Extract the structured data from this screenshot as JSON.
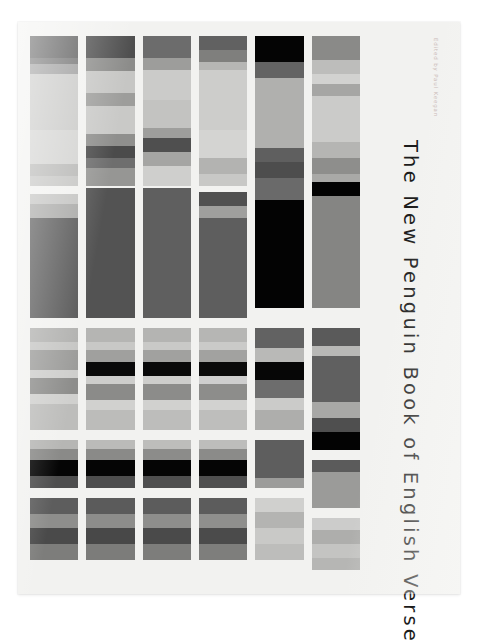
{
  "cover": {
    "title": "The New Penguin Book of English Verse",
    "credit": "Edited by Paul Keegan",
    "background": "#f2f2f0",
    "page_background": "#ffffff",
    "title_color": "#1b1b1b",
    "credit_color": "#c9b9b6"
  },
  "chart_data": {
    "type": "heatmap",
    "title": "The New Penguin Book of English Verse",
    "xlabel": "",
    "ylabel": "",
    "grid": false,
    "legend": "none",
    "columns": 6,
    "bands": 4,
    "column_width_px": 56,
    "column_gap_px": 8,
    "series": [
      {
        "name": "column-1",
        "blocks": [
          {
            "name": "block-1-1",
            "top": 0,
            "height": 150,
            "stripes": [
              {
                "color": "#5a5a5a",
                "height": 22
              },
              {
                "color": "#6e6e6e",
                "height": 6
              },
              {
                "color": "#9a9a9a",
                "height": 10
              },
              {
                "color": "#c8c8c6",
                "height": 56
              },
              {
                "color": "#d2d2d0",
                "height": 34
              },
              {
                "color": "#b7b7b5",
                "height": 12
              },
              {
                "color": "#c5c5c3",
                "height": 10
              }
            ]
          },
          {
            "name": "block-1-2",
            "top": 158,
            "height": 124,
            "stripes": [
              {
                "color": "#c3c3c1",
                "height": 10
              },
              {
                "color": "#a9a9a7",
                "height": 14
              },
              {
                "color": "#595959",
                "height": 100
              }
            ]
          },
          {
            "name": "block-1-3",
            "top": 292,
            "height": 102,
            "stripes": [
              {
                "color": "#b2b2b0",
                "height": 14
              },
              {
                "color": "#c6c6c4",
                "height": 8
              },
              {
                "color": "#9c9c9a",
                "height": 20
              },
              {
                "color": "#cececc",
                "height": 8
              },
              {
                "color": "#8d8d8b",
                "height": 16
              },
              {
                "color": "#d0d0ce",
                "height": 10
              },
              {
                "color": "#bdbdbb",
                "height": 26
              }
            ]
          },
          {
            "name": "block-1-4",
            "top": 404,
            "height": 48,
            "stripes": [
              {
                "color": "#b6b6b4",
                "height": 9
              },
              {
                "color": "#8a8a88",
                "height": 11
              },
              {
                "color": "#050505",
                "height": 16
              },
              {
                "color": "#4e4e4e",
                "height": 12
              }
            ]
          },
          {
            "name": "block-1-5",
            "top": 462,
            "height": 62,
            "stripes": [
              {
                "color": "#5d5d5d",
                "height": 16
              },
              {
                "color": "#8e8e8c",
                "height": 14
              },
              {
                "color": "#4a4a4a",
                "height": 16
              },
              {
                "color": "#7d7d7b",
                "height": 16
              }
            ]
          }
        ]
      },
      {
        "name": "column-2",
        "blocks": [
          {
            "name": "block-2-1",
            "top": 0,
            "height": 150,
            "stripes": [
              {
                "color": "#4e4e4e",
                "height": 22
              },
              {
                "color": "#8c8c8a",
                "height": 13
              },
              {
                "color": "#c6c6c4",
                "height": 22
              },
              {
                "color": "#9d9d9b",
                "height": 13
              },
              {
                "color": "#c9c9c7",
                "height": 28
              },
              {
                "color": "#8f8f8d",
                "height": 12
              },
              {
                "color": "#4b4b4b",
                "height": 12
              },
              {
                "color": "#6e6e6e",
                "height": 10
              },
              {
                "color": "#969694",
                "height": 18
              }
            ]
          },
          {
            "name": "block-2-2",
            "top": 152,
            "height": 130,
            "stripes": [
              {
                "color": "#535353",
                "height": 130
              }
            ]
          },
          {
            "name": "block-2-3",
            "top": 292,
            "height": 102,
            "stripes": [
              {
                "color": "#b5b5b3",
                "height": 14
              },
              {
                "color": "#c8c8c6",
                "height": 8
              },
              {
                "color": "#a0a09e",
                "height": 12
              },
              {
                "color": "#0a0a0a",
                "height": 14
              },
              {
                "color": "#cdcdcb",
                "height": 8
              },
              {
                "color": "#8b8b89",
                "height": 16
              },
              {
                "color": "#d1d1cf",
                "height": 10
              },
              {
                "color": "#bcbcba",
                "height": 20
              }
            ]
          },
          {
            "name": "block-2-4",
            "top": 404,
            "height": 48,
            "stripes": [
              {
                "color": "#bbbbb9",
                "height": 9
              },
              {
                "color": "#8a8a88",
                "height": 11
              },
              {
                "color": "#050505",
                "height": 16
              },
              {
                "color": "#4e4e4e",
                "height": 12
              }
            ]
          },
          {
            "name": "block-2-5",
            "top": 462,
            "height": 62,
            "stripes": [
              {
                "color": "#5b5b5b",
                "height": 16
              },
              {
                "color": "#8d8d8b",
                "height": 14
              },
              {
                "color": "#484848",
                "height": 16
              },
              {
                "color": "#7c7c7a",
                "height": 16
              }
            ]
          }
        ]
      },
      {
        "name": "column-3",
        "blocks": [
          {
            "name": "block-3-1",
            "top": 0,
            "height": 150,
            "stripes": [
              {
                "color": "#6c6c6c",
                "height": 22
              },
              {
                "color": "#9d9d9b",
                "height": 12
              },
              {
                "color": "#cbcbc9",
                "height": 30
              },
              {
                "color": "#c3c3c1",
                "height": 28
              },
              {
                "color": "#9e9e9c",
                "height": 10
              },
              {
                "color": "#4f4f4f",
                "height": 14
              },
              {
                "color": "#a5a5a3",
                "height": 14
              },
              {
                "color": "#cfcfcd",
                "height": 20
              }
            ]
          },
          {
            "name": "block-3-2",
            "top": 152,
            "height": 130,
            "stripes": [
              {
                "color": "#5f5f5f",
                "height": 130
              }
            ]
          },
          {
            "name": "block-3-3",
            "top": 292,
            "height": 102,
            "stripes": [
              {
                "color": "#b4b4b2",
                "height": 14
              },
              {
                "color": "#c9c9c7",
                "height": 8
              },
              {
                "color": "#a1a19f",
                "height": 12
              },
              {
                "color": "#090909",
                "height": 14
              },
              {
                "color": "#cdcdcb",
                "height": 8
              },
              {
                "color": "#8c8c8a",
                "height": 16
              },
              {
                "color": "#d1d1cf",
                "height": 10
              },
              {
                "color": "#bdbdbb",
                "height": 20
              }
            ]
          },
          {
            "name": "block-3-4",
            "top": 404,
            "height": 48,
            "stripes": [
              {
                "color": "#bdbdbb",
                "height": 9
              },
              {
                "color": "#8c8c8a",
                "height": 11
              },
              {
                "color": "#050505",
                "height": 16
              },
              {
                "color": "#4f4f4f",
                "height": 12
              }
            ]
          },
          {
            "name": "block-3-5",
            "top": 462,
            "height": 62,
            "stripes": [
              {
                "color": "#5c5c5c",
                "height": 16
              },
              {
                "color": "#8e8e8c",
                "height": 14
              },
              {
                "color": "#4a4a4a",
                "height": 16
              },
              {
                "color": "#7d7d7b",
                "height": 16
              }
            ]
          }
        ]
      },
      {
        "name": "column-4",
        "blocks": [
          {
            "name": "block-4-1",
            "top": 0,
            "height": 150,
            "stripes": [
              {
                "color": "#616161",
                "height": 14
              },
              {
                "color": "#7f7f7d",
                "height": 12
              },
              {
                "color": "#b6b6b4",
                "height": 8
              },
              {
                "color": "#cdcdcb",
                "height": 60
              },
              {
                "color": "#d4d4d2",
                "height": 28
              },
              {
                "color": "#b3b3b1",
                "height": 16
              },
              {
                "color": "#c8c8c6",
                "height": 12
              }
            ]
          },
          {
            "name": "block-4-2",
            "top": 156,
            "height": 126,
            "stripes": [
              {
                "color": "#505050",
                "height": 14
              },
              {
                "color": "#9f9f9d",
                "height": 12
              },
              {
                "color": "#5e5e5e",
                "height": 100
              }
            ]
          },
          {
            "name": "block-4-3",
            "top": 292,
            "height": 102,
            "stripes": [
              {
                "color": "#b6b6b4",
                "height": 14
              },
              {
                "color": "#cacac8",
                "height": 8
              },
              {
                "color": "#a2a2a0",
                "height": 12
              },
              {
                "color": "#0a0a0a",
                "height": 14
              },
              {
                "color": "#cecece",
                "height": 8
              },
              {
                "color": "#8d8d8b",
                "height": 16
              },
              {
                "color": "#d2d2d0",
                "height": 10
              },
              {
                "color": "#bebebc",
                "height": 20
              }
            ]
          },
          {
            "name": "block-4-4",
            "top": 404,
            "height": 48,
            "stripes": [
              {
                "color": "#bdbdbb",
                "height": 9
              },
              {
                "color": "#8b8b89",
                "height": 11
              },
              {
                "color": "#050505",
                "height": 16
              },
              {
                "color": "#4f4f4f",
                "height": 12
              }
            ]
          },
          {
            "name": "block-4-5",
            "top": 462,
            "height": 62,
            "stripes": [
              {
                "color": "#5c5c5c",
                "height": 16
              },
              {
                "color": "#8f8f8d",
                "height": 14
              },
              {
                "color": "#4b4b4b",
                "height": 16
              },
              {
                "color": "#7e7e7c",
                "height": 16
              }
            ]
          }
        ]
      },
      {
        "name": "column-5",
        "blocks": [
          {
            "name": "block-5-1",
            "top": 0,
            "height": 272,
            "stripes": [
              {
                "color": "#040404",
                "height": 26
              },
              {
                "color": "#636363",
                "height": 16
              },
              {
                "color": "#b0b0ae",
                "height": 70
              },
              {
                "color": "#5f5f5f",
                "height": 14
              },
              {
                "color": "#4d4d4d",
                "height": 16
              },
              {
                "color": "#6a6a6a",
                "height": 22
              },
              {
                "color": "#030303",
                "height": 108
              }
            ]
          },
          {
            "name": "block-5-2",
            "top": 292,
            "height": 102,
            "stripes": [
              {
                "color": "#626262",
                "height": 20
              },
              {
                "color": "#b9b9b7",
                "height": 14
              },
              {
                "color": "#060606",
                "height": 18
              },
              {
                "color": "#6d6d6d",
                "height": 18
              },
              {
                "color": "#cbcbc9",
                "height": 12
              },
              {
                "color": "#aeaeac",
                "height": 20
              }
            ]
          },
          {
            "name": "block-5-3",
            "top": 404,
            "height": 48,
            "stripes": [
              {
                "color": "#5e5e5e",
                "height": 38
              },
              {
                "color": "#9c9c9a",
                "height": 10
              }
            ]
          },
          {
            "name": "block-5-4",
            "top": 462,
            "height": 62,
            "stripes": [
              {
                "color": "#d0d0ce",
                "height": 14
              },
              {
                "color": "#b4b4b2",
                "height": 16
              },
              {
                "color": "#c9c9c7",
                "height": 16
              },
              {
                "color": "#bdbdbb",
                "height": 16
              }
            ]
          }
        ]
      },
      {
        "name": "column-6",
        "blocks": [
          {
            "name": "block-6-1",
            "top": 0,
            "height": 272,
            "stripes": [
              {
                "color": "#8a8a88",
                "height": 24
              },
              {
                "color": "#bdbdbb",
                "height": 14
              },
              {
                "color": "#d2d2d0",
                "height": 10
              },
              {
                "color": "#a6a6a4",
                "height": 12
              },
              {
                "color": "#cbcbc9",
                "height": 46
              },
              {
                "color": "#b5b5b3",
                "height": 16
              },
              {
                "color": "#8e8e8c",
                "height": 16
              },
              {
                "color": "#a9a9a7",
                "height": 8
              },
              {
                "color": "#030303",
                "height": 14
              },
              {
                "color": "#858583",
                "height": 112
              }
            ]
          },
          {
            "name": "block-6-2",
            "top": 292,
            "height": 122,
            "stripes": [
              {
                "color": "#5a5a5a",
                "height": 18
              },
              {
                "color": "#b8b8b6",
                "height": 10
              },
              {
                "color": "#606060",
                "height": 46
              },
              {
                "color": "#a8a8a6",
                "height": 16
              },
              {
                "color": "#4f4f4f",
                "height": 14
              },
              {
                "color": "#030303",
                "height": 18
              }
            ]
          },
          {
            "name": "block-6-3",
            "top": 424,
            "height": 48,
            "stripes": [
              {
                "color": "#5b5b5b",
                "height": 12
              },
              {
                "color": "#9b9b99",
                "height": 36
              }
            ]
          },
          {
            "name": "block-6-4",
            "top": 482,
            "height": 52,
            "stripes": [
              {
                "color": "#cccccb",
                "height": 12
              },
              {
                "color": "#aeaeac",
                "height": 14
              },
              {
                "color": "#c4c4c2",
                "height": 14
              },
              {
                "color": "#b6b6b4",
                "height": 12
              }
            ]
          }
        ]
      }
    ]
  }
}
